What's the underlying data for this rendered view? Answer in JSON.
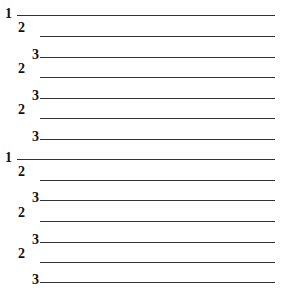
{
  "outline": {
    "rows": [
      {
        "level": 1,
        "label": "1"
      },
      {
        "level": 2,
        "label": "2"
      },
      {
        "level": 3,
        "label": "3"
      },
      {
        "level": 2,
        "label": "2"
      },
      {
        "level": 3,
        "label": "3"
      },
      {
        "level": 2,
        "label": "2"
      },
      {
        "level": 3,
        "label": "3"
      },
      {
        "level": 1,
        "label": "1"
      },
      {
        "level": 2,
        "label": "2"
      },
      {
        "level": 3,
        "label": "3"
      },
      {
        "level": 2,
        "label": "2"
      },
      {
        "level": 3,
        "label": "3"
      },
      {
        "level": 2,
        "label": "2"
      },
      {
        "level": 3,
        "label": "3"
      }
    ]
  }
}
